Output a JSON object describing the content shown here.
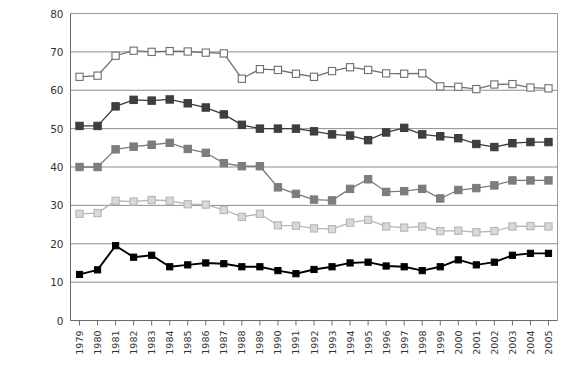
{
  "chart_data": {
    "type": "line",
    "title": "",
    "subtitle": "",
    "xlabel": "",
    "ylabel": "Participation tax rate (%)",
    "xlim": [
      1979,
      2005
    ],
    "ylim": [
      0,
      80
    ],
    "yticks": [
      0,
      10,
      20,
      30,
      40,
      50,
      60,
      70,
      80
    ],
    "grid": "horizontal-major",
    "grid_values": [
      10,
      20,
      30,
      40,
      50,
      60,
      70,
      80
    ],
    "legend_position": "none",
    "legend": [],
    "x": [
      1979,
      1980,
      1981,
      1982,
      1983,
      1984,
      1985,
      1986,
      1987,
      1988,
      1989,
      1990,
      1991,
      1992,
      1993,
      1994,
      1995,
      1996,
      1997,
      1998,
      1999,
      2000,
      2001,
      2002,
      2003,
      2004,
      2005
    ],
    "categories": [
      "1979",
      "1980",
      "1981",
      "1982",
      "1983",
      "1984",
      "1985",
      "1986",
      "1987",
      "1988",
      "1989",
      "1990",
      "1991",
      "1992",
      "1993",
      "1994",
      "1995",
      "1996",
      "1997",
      "1998",
      "1999",
      "2000",
      "2001",
      "2002",
      "2003",
      "2004",
      "2005"
    ],
    "series": [
      {
        "name": "series-1-open-white",
        "marker": "square-open-white",
        "color": "#6e6e6e",
        "fill": "#ffffff",
        "values": [
          63.5,
          63.8,
          69.0,
          70.3,
          70.0,
          70.2,
          70.1,
          69.8,
          69.6,
          63.0,
          65.5,
          65.3,
          64.3,
          63.5,
          65.0,
          66.0,
          65.3,
          64.4,
          64.3,
          64.4,
          61.0,
          60.9,
          60.3,
          61.5,
          61.6,
          60.7,
          60.5
        ]
      },
      {
        "name": "series-2-dark-gray",
        "marker": "square-filled",
        "color": "#3a3a3a",
        "fill": "#3f3f3f",
        "values": [
          50.7,
          50.7,
          55.8,
          57.5,
          57.3,
          57.6,
          56.6,
          55.5,
          53.7,
          51.0,
          50.0,
          50.0,
          50.0,
          49.3,
          48.5,
          48.2,
          47.0,
          49.0,
          50.2,
          48.5,
          48.0,
          47.5,
          46.0,
          45.2,
          46.2,
          46.5,
          46.5
        ]
      },
      {
        "name": "series-3-medium-gray",
        "marker": "square-filled",
        "color": "#7a7a7a",
        "fill": "#7d7d7d",
        "values": [
          40.0,
          40.0,
          44.6,
          45.3,
          45.8,
          46.3,
          44.7,
          43.7,
          41.0,
          40.2,
          40.2,
          34.7,
          33.0,
          31.5,
          31.3,
          34.3,
          36.8,
          33.5,
          33.7,
          34.3,
          31.8,
          34.0,
          34.5,
          35.2,
          36.5,
          36.5,
          36.5
        ]
      },
      {
        "name": "series-4-light-gray-open",
        "marker": "square-open-light",
        "color": "#b6b6b6",
        "fill": "#d8d8d8",
        "values": [
          27.8,
          28.0,
          31.2,
          31.0,
          31.4,
          31.2,
          30.3,
          30.2,
          28.8,
          27.0,
          27.8,
          24.8,
          24.7,
          24.0,
          23.8,
          25.5,
          26.2,
          24.5,
          24.2,
          24.5,
          23.3,
          23.4,
          23.0,
          23.3,
          24.5,
          24.6,
          24.5
        ]
      },
      {
        "name": "series-5-black",
        "marker": "square-filled",
        "color": "#000000",
        "fill": "#000000",
        "values": [
          12.0,
          13.2,
          19.5,
          16.5,
          17.0,
          14.0,
          14.5,
          15.0,
          14.8,
          14.0,
          14.0,
          13.0,
          12.2,
          13.3,
          14.0,
          15.0,
          15.2,
          14.2,
          14.0,
          13.0,
          14.0,
          15.8,
          14.5,
          15.2,
          17.0,
          17.5,
          17.5
        ]
      }
    ]
  },
  "axis": {
    "y_title": "Participation tax rate (%)",
    "y_tick_labels": [
      "0",
      "10",
      "20",
      "30",
      "40",
      "50",
      "60",
      "70",
      "80"
    ],
    "x_tick_labels": [
      "1979",
      "1980",
      "1981",
      "1982",
      "1983",
      "1984",
      "1985",
      "1986",
      "1987",
      "1988",
      "1989",
      "1990",
      "1991",
      "1992",
      "1993",
      "1994",
      "1995",
      "1996",
      "1997",
      "1998",
      "1999",
      "2000",
      "2001",
      "2002",
      "2003",
      "2004",
      "2005"
    ]
  },
  "colors": {
    "grid": "#808080",
    "border": "#9a9a9a",
    "text": "#333333",
    "series1_line": "#6e6e6e",
    "series1_fill": "#ffffff",
    "series2_line": "#3a3a3a",
    "series2_fill": "#3f3f3f",
    "series3_line": "#7a7a7a",
    "series3_fill": "#7d7d7d",
    "series4_line": "#b6b6b6",
    "series4_fill": "#d8d8d8",
    "series5_line": "#000000",
    "series5_fill": "#000000"
  }
}
